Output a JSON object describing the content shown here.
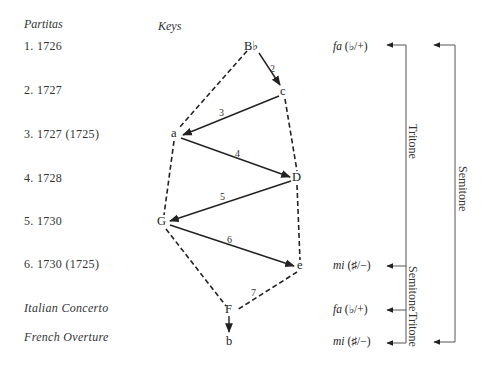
{
  "headers": {
    "partitas": "Partitas",
    "keys": "Keys"
  },
  "rows": [
    {
      "label": "1. 1726",
      "y": 47
    },
    {
      "label": "2. 1727",
      "y": 91
    },
    {
      "label": "3. 1727 (1725)",
      "y": 135
    },
    {
      "label": "4. 1728",
      "y": 179
    },
    {
      "label": "5. 1730",
      "y": 221
    },
    {
      "label": "6. 1730 (1725)",
      "y": 265
    },
    {
      "label": "Italian Concerto",
      "y": 308,
      "italic": true
    },
    {
      "label": "French Overture",
      "y": 337,
      "italic": true
    }
  ],
  "nodes": [
    {
      "id": "Bb",
      "label": "B♭",
      "x": 254,
      "y": 47
    },
    {
      "id": "c",
      "label": "c",
      "x": 283,
      "y": 92
    },
    {
      "id": "a",
      "label": "a",
      "x": 175,
      "y": 134
    },
    {
      "id": "D",
      "label": "D",
      "x": 297,
      "y": 178
    },
    {
      "id": "G",
      "label": "G",
      "x": 163,
      "y": 222
    },
    {
      "id": "e",
      "label": "e",
      "x": 300,
      "y": 266
    },
    {
      "id": "F",
      "label": "F",
      "x": 230,
      "y": 310
    },
    {
      "id": "b",
      "label": "b",
      "x": 230,
      "y": 341
    }
  ],
  "solid_edges": [
    {
      "from": "Bb",
      "to": "c",
      "label": "2"
    },
    {
      "from": "c",
      "to": "a",
      "label": "3"
    },
    {
      "from": "a",
      "to": "D",
      "label": "4"
    },
    {
      "from": "D",
      "to": "G",
      "label": "5"
    },
    {
      "from": "G",
      "to": "e",
      "label": "6"
    },
    {
      "from": "F",
      "to": "b",
      "label": ""
    }
  ],
  "dashed_edges": [
    {
      "from": "Bb",
      "to": "a"
    },
    {
      "from": "a",
      "to": "G"
    },
    {
      "from": "G",
      "to": "F"
    },
    {
      "from": "c",
      "to": "D"
    },
    {
      "from": "D",
      "to": "e"
    },
    {
      "from": "e",
      "to": "F",
      "label": "7"
    }
  ],
  "edge_labels": {
    "e2": "2",
    "e3": "3",
    "e4": "4",
    "e5": "5",
    "e6": "6",
    "e7": "7"
  },
  "solmization": [
    {
      "syllable": "fa",
      "sign": "(♭/+)",
      "y": 47
    },
    {
      "syllable": "mi",
      "sign": "(♯/−)",
      "y": 266
    },
    {
      "syllable": "fa",
      "sign": "(♭/+)",
      "y": 310
    },
    {
      "syllable": "mi",
      "sign": "(♯/−)",
      "y": 342
    }
  ],
  "brackets": {
    "inner": {
      "upper_label": "Tritone",
      "middle_label": "Semitone",
      "lower_label": "Tritone"
    },
    "outer": {
      "label": "Semitone"
    }
  }
}
